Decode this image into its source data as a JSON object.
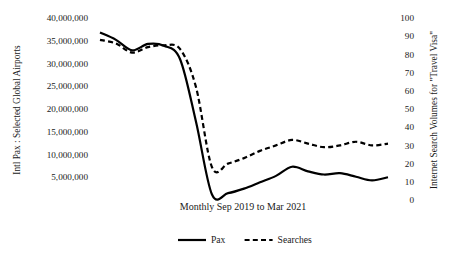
{
  "chart_data": {
    "type": "line",
    "title": "",
    "xlabel": "Monthly Sep 2019 to Mar 2021",
    "ylabel": "Intl Pax : Selected Global Airports",
    "y2label": "Internet Search Volumes for \"Travel Visa\"",
    "grid": false,
    "legend_position": "bottom-center",
    "x": [
      "Sep 2019",
      "Oct 2019",
      "Nov 2019",
      "Dec 2019",
      "Jan 2020",
      "Feb 2020",
      "Mar 2020",
      "Apr 2020",
      "May 2020",
      "Jun 2020",
      "Jul 2020",
      "Aug 2020",
      "Sep 2020",
      "Oct 2020",
      "Nov 2020",
      "Dec 2020",
      "Jan 2021",
      "Feb 2021",
      "Mar 2021"
    ],
    "ylim": [
      0,
      40000000
    ],
    "y2lim": [
      0,
      100
    ],
    "yticks": [
      "5,000,000",
      "10,000,000",
      "15,000,000",
      "20,000,000",
      "25,000,000",
      "30,000,000",
      "35,000,000",
      "40,000,000"
    ],
    "ytick_values": [
      5000000,
      10000000,
      15000000,
      20000000,
      25000000,
      30000000,
      35000000,
      40000000
    ],
    "y2ticks": [
      "0",
      "10",
      "20",
      "30",
      "40",
      "50",
      "60",
      "70",
      "80",
      "90",
      "100"
    ],
    "y2tick_values": [
      0,
      10,
      20,
      30,
      40,
      50,
      60,
      70,
      80,
      90,
      100
    ],
    "series": [
      {
        "name": "Pax",
        "axis": "left",
        "style": "solid",
        "color": "#000000",
        "values": [
          36800000,
          35200000,
          32900000,
          34300000,
          33900000,
          31000000,
          17200000,
          1200000,
          1500000,
          2500000,
          3900000,
          5300000,
          7300000,
          6300000,
          5600000,
          5900000,
          5100000,
          4300000,
          5000000
        ]
      },
      {
        "name": "Searches",
        "axis": "right",
        "style": "dashed",
        "color": "#000000",
        "values": [
          88,
          86,
          81,
          84,
          85,
          83,
          62,
          18,
          20,
          23,
          27,
          30,
          33,
          31,
          29,
          30,
          32,
          30,
          31
        ]
      }
    ]
  },
  "legend": {
    "items": [
      {
        "label": "Pax",
        "style": "solid"
      },
      {
        "label": "Searches",
        "style": "dashed"
      }
    ]
  },
  "axes": {
    "left_title": "Intl Pax : Selected Global Airports",
    "right_title": "Internet Search Volumes for \"Travel Visa\"",
    "x_title": "Monthly Sep 2019 to Mar 2021"
  }
}
